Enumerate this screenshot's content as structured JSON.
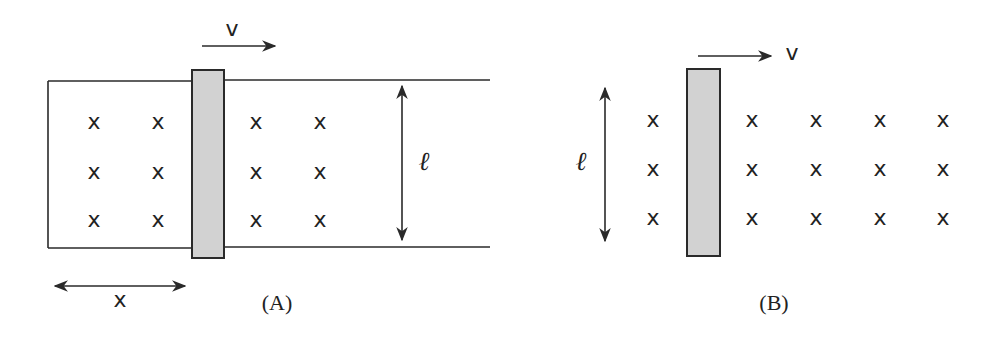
{
  "figure": {
    "panels": [
      {
        "id": "A",
        "caption": "(A)",
        "velocity_label": "v",
        "length_label": "ℓ",
        "distance_label": "x",
        "field_symbol": "x",
        "field_grid": {
          "rows": 3,
          "cols_left_of_bar": 2,
          "cols_right_of_bar": 2
        },
        "has_rails": true
      },
      {
        "id": "B",
        "caption": "(B)",
        "velocity_label": "v",
        "length_label": "ℓ",
        "field_symbol": "x",
        "field_grid": {
          "rows": 3,
          "cols_left_of_bar": 1,
          "cols_right_of_bar": 4
        },
        "has_rails": false
      }
    ],
    "colors": {
      "bar_fill": "#d2d2d2",
      "stroke": "#2a2a2a",
      "background": "#ffffff"
    }
  }
}
